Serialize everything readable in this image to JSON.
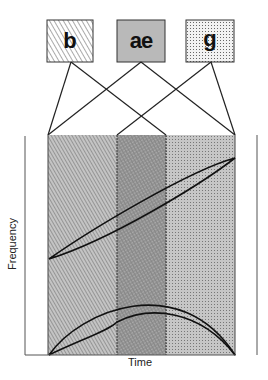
{
  "phonemes": [
    {
      "label": "b",
      "pattern": "hatch"
    },
    {
      "label": "ae",
      "pattern": "gray"
    },
    {
      "label": "g",
      "pattern": "dots"
    }
  ],
  "axes": {
    "x_label": "Time",
    "y_label": "Frequency"
  },
  "colors": {
    "stroke": "#222222",
    "gray_fill": "#b9b9b9",
    "region_bg": "#bdbdbd"
  }
}
